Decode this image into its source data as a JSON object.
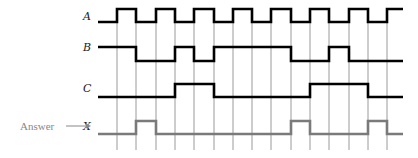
{
  "diagram": {
    "type": "timing-diagram",
    "x_start": 98,
    "x_end": 403,
    "gridlines_x": [
      117,
      136,
      156,
      175,
      194,
      214,
      233,
      252,
      271,
      291,
      310,
      329,
      349,
      368,
      387
    ],
    "grid_top": 22,
    "grid_bottom": 150,
    "signals": [
      {
        "name": "A",
        "role": "input",
        "y_high": 9,
        "y_low": 22,
        "label_y": 20,
        "initial": 0,
        "levels": [
          1,
          0,
          1,
          0,
          1,
          0,
          1,
          0,
          1,
          0,
          1,
          0,
          1,
          0,
          1
        ]
      },
      {
        "name": "B",
        "role": "input",
        "y_high": 47,
        "y_low": 61,
        "label_y": 51,
        "initial": 1,
        "levels": [
          1,
          0,
          0,
          1,
          0,
          1,
          1,
          1,
          1,
          0,
          0,
          1,
          0,
          0,
          0
        ]
      },
      {
        "name": "C",
        "role": "input",
        "y_high": 84,
        "y_low": 97,
        "label_y": 92,
        "initial": 0,
        "levels": [
          0,
          0,
          0,
          1,
          1,
          0,
          0,
          0,
          0,
          0,
          1,
          1,
          1,
          0,
          0
        ]
      },
      {
        "name": "X",
        "role": "output",
        "y_high": 121,
        "y_low": 134,
        "label_y": 130,
        "initial": 0,
        "levels": [
          0,
          1,
          0,
          0,
          0,
          0,
          0,
          0,
          0,
          1,
          0,
          0,
          0,
          1,
          0
        ]
      }
    ],
    "answer_label": "Answer",
    "arrow": "⟶"
  }
}
